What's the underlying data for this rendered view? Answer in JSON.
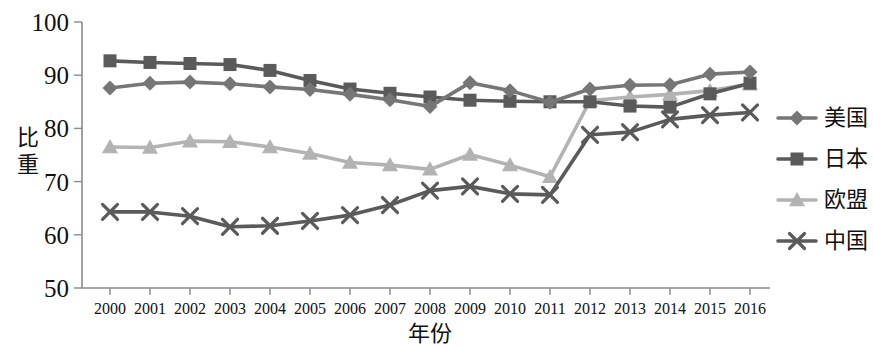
{
  "chart_data": {
    "type": "line",
    "title": "",
    "xlabel": "年份",
    "ylabel": "比重",
    "ylim": [
      50,
      100
    ],
    "y_ticks": [
      50,
      60,
      70,
      80,
      90,
      100
    ],
    "grid": false,
    "legend_position": "right",
    "categories": [
      "2000",
      "2001",
      "2002",
      "2003",
      "2004",
      "2005",
      "2006",
      "2007",
      "2008",
      "2009",
      "2010",
      "2011",
      "2012",
      "2013",
      "2014",
      "2015",
      "2016"
    ],
    "series": [
      {
        "name": "美国",
        "marker": "diamond",
        "color": "#767676",
        "values": [
          87.6,
          88.5,
          88.7,
          88.4,
          87.8,
          87.3,
          86.4,
          85.4,
          84.1,
          88.6,
          87.1,
          84.9,
          87.4,
          88.1,
          88.2,
          90.2,
          90.6
        ]
      },
      {
        "name": "日本",
        "marker": "square",
        "color": "#5a5a5a",
        "values": [
          92.7,
          92.4,
          92.2,
          92.0,
          90.9,
          89.0,
          87.4,
          86.6,
          85.9,
          85.3,
          85.1,
          85.0,
          85.0,
          84.2,
          84.0,
          86.5,
          88.5
        ]
      },
      {
        "name": "欧盟",
        "marker": "triangle",
        "color": "#b3b3b3",
        "values": [
          76.5,
          76.4,
          77.6,
          77.5,
          76.5,
          75.3,
          73.6,
          73.1,
          72.3,
          75.1,
          73.1,
          70.9,
          85.2,
          85.9,
          86.4,
          87.1,
          88.3
        ]
      },
      {
        "name": "中国",
        "marker": "cross",
        "color": "#5a5a5a",
        "values": [
          64.3,
          64.3,
          63.5,
          61.5,
          61.7,
          62.6,
          63.7,
          65.6,
          68.3,
          69.1,
          67.7,
          67.5,
          78.8,
          79.3,
          81.7,
          82.5,
          83.0
        ]
      }
    ]
  },
  "legend": {
    "items": [
      {
        "label": "美国"
      },
      {
        "label": "日本"
      },
      {
        "label": "欧盟"
      },
      {
        "label": "中国"
      }
    ]
  }
}
